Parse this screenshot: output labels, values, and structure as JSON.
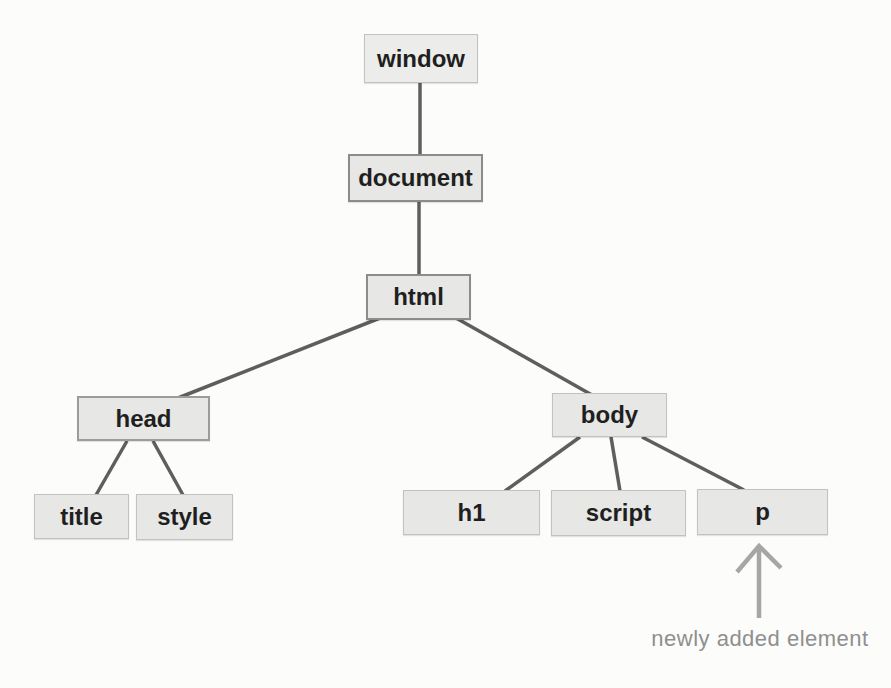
{
  "diagram": {
    "type": "tree",
    "nodes": [
      {
        "id": "window",
        "label": "window"
      },
      {
        "id": "document",
        "label": "document"
      },
      {
        "id": "html",
        "label": "html"
      },
      {
        "id": "head",
        "label": "head"
      },
      {
        "id": "body",
        "label": "body"
      },
      {
        "id": "title",
        "label": "title"
      },
      {
        "id": "style",
        "label": "style"
      },
      {
        "id": "h1",
        "label": "h1"
      },
      {
        "id": "script",
        "label": "script"
      },
      {
        "id": "p",
        "label": "p"
      }
    ],
    "edges": [
      {
        "from": "window",
        "to": "document"
      },
      {
        "from": "document",
        "to": "html"
      },
      {
        "from": "html",
        "to": "head"
      },
      {
        "from": "html",
        "to": "body"
      },
      {
        "from": "head",
        "to": "title"
      },
      {
        "from": "head",
        "to": "style"
      },
      {
        "from": "body",
        "to": "h1"
      },
      {
        "from": "body",
        "to": "script"
      },
      {
        "from": "body",
        "to": "p"
      }
    ],
    "annotation": {
      "label": "newly added element",
      "target": "p"
    },
    "colors": {
      "background": "#fcfcfa",
      "node_fill": "#e7e7e5",
      "node_border_light": "#c2c2c0",
      "node_border_dark": "#8c8c8a",
      "node_text": "#1f1f1f",
      "edge_line": "#5e5e5e",
      "arrow": "#a6a6a6",
      "annotation_text": "#8f8f8f"
    }
  }
}
